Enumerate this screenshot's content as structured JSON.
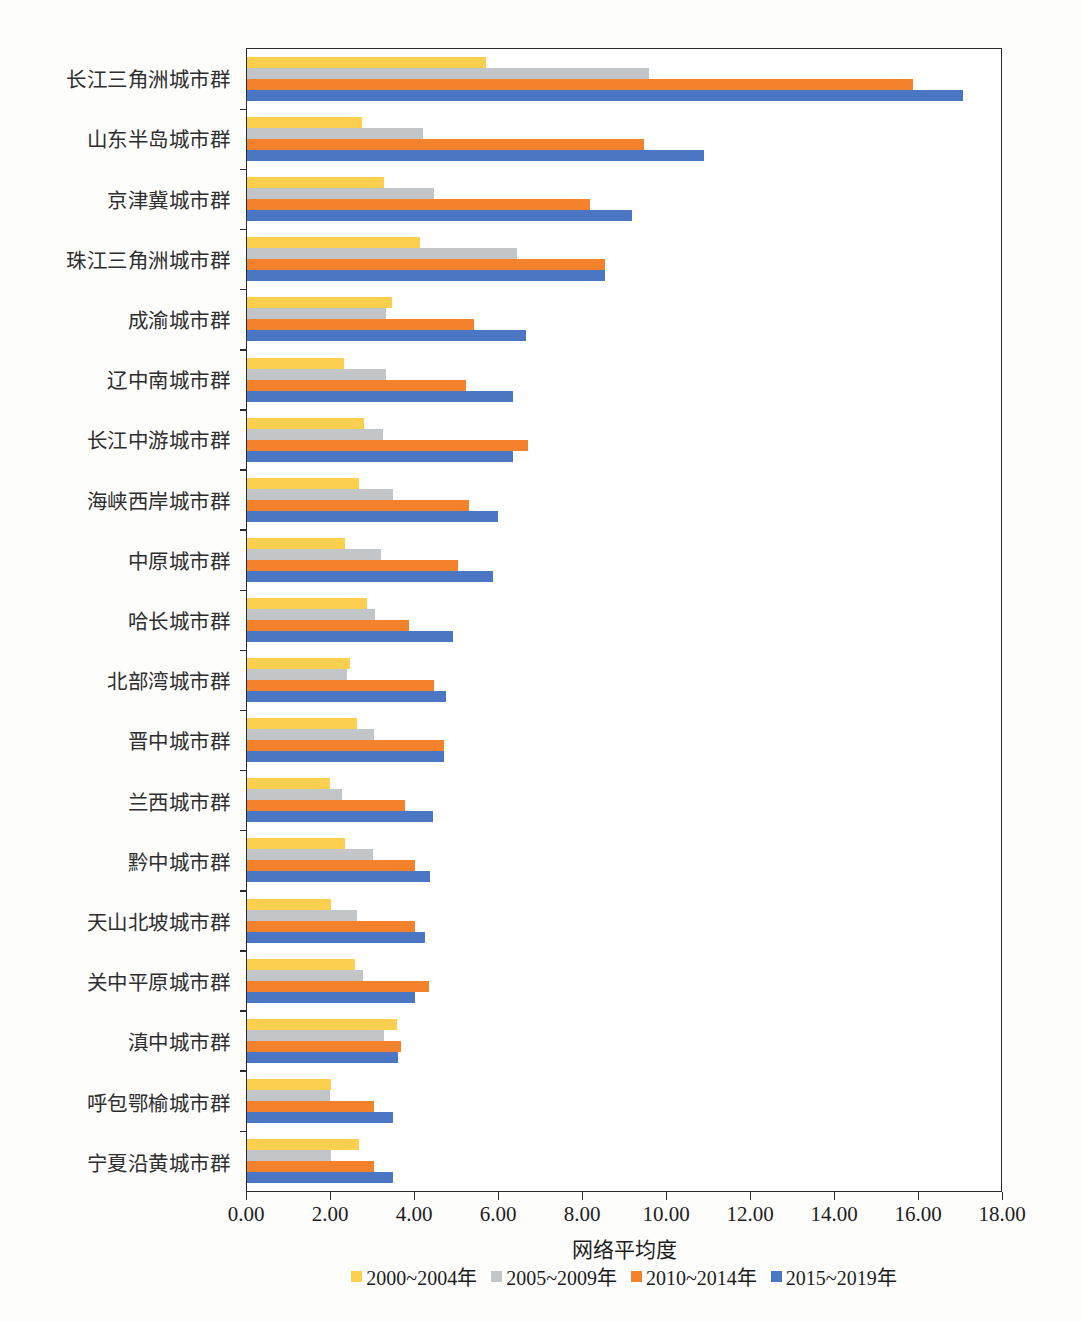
{
  "chart_data": {
    "type": "bar",
    "orientation": "horizontal",
    "title": "",
    "xlabel": "网络平均度",
    "ylabel": "",
    "xlim": [
      0,
      18
    ],
    "xticks": [
      "0.00",
      "2.00",
      "4.00",
      "6.00",
      "8.00",
      "10.00",
      "12.00",
      "14.00",
      "16.00",
      "18.00"
    ],
    "xtick_values": [
      0,
      2,
      4,
      6,
      8,
      10,
      12,
      14,
      16,
      18
    ],
    "grid": false,
    "legend_position": "bottom",
    "categories": [
      "长江三角洲城市群",
      "山东半岛城市群",
      "京津冀城市群",
      "珠江三角洲城市群",
      "成渝城市群",
      "辽中南城市群",
      "长江中游城市群",
      "海峡西岸城市群",
      "中原城市群",
      "哈长城市群",
      "北部湾城市群",
      "晋中城市群",
      "兰西城市群",
      "黔中城市群",
      "天山北坡城市群",
      "关中平原城市群",
      "滇中城市群",
      "呼包鄂榆城市群",
      "宁夏沿黄城市群"
    ],
    "series": [
      {
        "name": "2000~2004年",
        "color": "#fdcf4e",
        "values": [
          5.7,
          2.74,
          3.26,
          4.14,
          3.47,
          2.32,
          2.79,
          2.67,
          2.33,
          2.87,
          2.46,
          2.63,
          1.98,
          2.33,
          2.0,
          2.59,
          3.59,
          2.0,
          2.67
        ]
      },
      {
        "name": "2005~2009年",
        "color": "#c3c6c8",
        "values": [
          9.6,
          4.21,
          4.46,
          6.45,
          3.32,
          3.33,
          3.24,
          3.48,
          3.19,
          3.06,
          2.38,
          3.02,
          2.26,
          3.0,
          2.62,
          2.78,
          3.27,
          1.98,
          2.0
        ]
      },
      {
        "name": "2010~2014年",
        "color": "#f4812c",
        "values": [
          15.9,
          9.47,
          8.19,
          8.54,
          5.41,
          5.22,
          6.7,
          5.3,
          5.04,
          3.87,
          4.46,
          4.7,
          3.77,
          4.02,
          4.01,
          4.35,
          3.67,
          3.03,
          3.02
        ]
      },
      {
        "name": "2015~2019年",
        "color": "#4a76c4",
        "values": [
          17.1,
          10.9,
          9.2,
          8.54,
          6.67,
          6.36,
          6.35,
          6.0,
          5.87,
          4.92,
          4.74,
          4.7,
          4.45,
          4.36,
          4.26,
          4.01,
          3.61,
          3.49,
          3.49
        ]
      }
    ]
  },
  "caption": ""
}
